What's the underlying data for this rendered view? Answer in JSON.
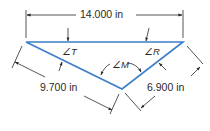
{
  "diagram": {
    "type": "triangle-dimension-drawing",
    "colors": {
      "triangle_stroke": "#3a7fc8",
      "dimension_stroke": "#2a2a2a",
      "text": "#2a2a2a",
      "background": "#ffffff"
    },
    "vertices": {
      "left": {
        "x": 26,
        "y": 42
      },
      "right": {
        "x": 183,
        "y": 42
      },
      "bottom": {
        "x": 122,
        "y": 89
      }
    },
    "dimensions": {
      "top": {
        "label": "14.000 in",
        "side": "left-right"
      },
      "left": {
        "label": "9.700 in",
        "side": "left-bottom"
      },
      "right": {
        "label": "6.900 in",
        "side": "right-bottom"
      }
    },
    "angles": {
      "T": {
        "label": "∠T",
        "vertex": "left"
      },
      "R": {
        "label": "∠R",
        "vertex": "right"
      },
      "M": {
        "label": "∠M",
        "vertex": "bottom"
      }
    }
  }
}
